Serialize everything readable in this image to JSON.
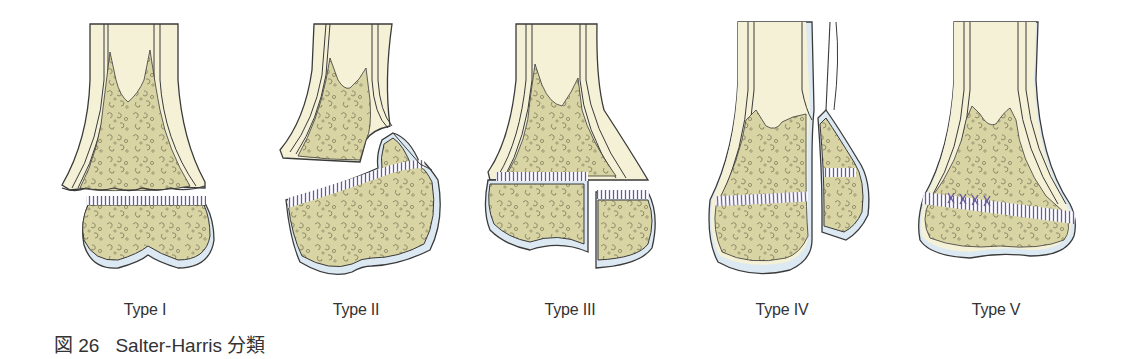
{
  "figure": {
    "caption_prefix": "図 26",
    "caption_title": "Salter-Harris 分類",
    "colors": {
      "cortex": "#f4f1d6",
      "cancellous": "#d8d4a4",
      "cartilage_cap": "#dce9f2",
      "outline": "#3a3a3a",
      "physis_hatch": "#6a5a9a",
      "trabecular_pattern": "#8e8a68"
    },
    "panels": [
      {
        "id": "type-1",
        "label": "Type I",
        "center_x": 145
      },
      {
        "id": "type-2",
        "label": "Type II",
        "center_x": 356
      },
      {
        "id": "type-3",
        "label": "Type III",
        "center_x": 570
      },
      {
        "id": "type-4",
        "label": "Type IV",
        "center_x": 782
      },
      {
        "id": "type-5",
        "label": "Type V",
        "center_x": 996
      }
    ]
  }
}
